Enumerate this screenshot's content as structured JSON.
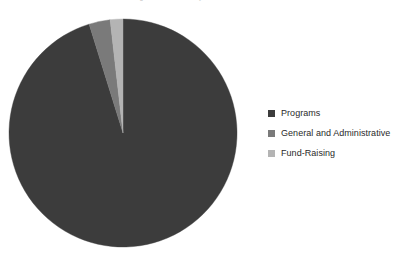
{
  "caption": {
    "top_clipped_text": "financial statements of the organization for the year then ended"
  },
  "legend": {
    "position": "right",
    "items": [
      {
        "label": "Programs",
        "color": "#3c3c3c",
        "swatch_icon": "square-swatch-icon"
      },
      {
        "label": "General and Administrative",
        "color": "#7a7a7a",
        "swatch_icon": "square-swatch-icon"
      },
      {
        "label": "Fund-Raising",
        "color": "#b4b4b4",
        "swatch_icon": "square-swatch-icon"
      }
    ]
  },
  "pie_geometry": {
    "center_x": 123,
    "center_y": 133,
    "radius": 114,
    "start_angle_deg": 0,
    "direction": "clockwise"
  },
  "chart_data": {
    "type": "pie",
    "title": "",
    "subtitle": "",
    "xlabel": "",
    "ylabel": "",
    "grid": false,
    "legend_position": "right",
    "categories": [
      "Programs",
      "General and Administrative",
      "Fund-Raising"
    ],
    "values": [
      95.2,
      3.0,
      1.8
    ],
    "units": "percent",
    "colors": [
      "#3c3c3c",
      "#7a7a7a",
      "#b4b4b4"
    ],
    "annotations": [],
    "series": [
      {
        "name": "Expense Allocation",
        "values": [
          95.2,
          3.0,
          1.8
        ]
      }
    ]
  },
  "style": {
    "background": "#ffffff",
    "text_color": "#2a2a2a"
  }
}
